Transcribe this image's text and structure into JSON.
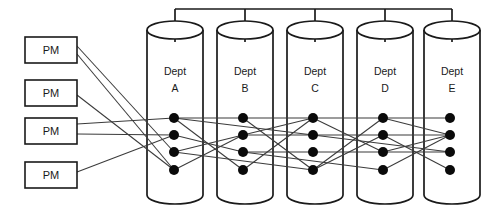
{
  "diagram": {
    "colors": {
      "stroke": "#1a1a1a",
      "edge": "#3b3b3b",
      "node": "#0a0a0a",
      "background": "#ffffff"
    },
    "pm_boxes": [
      {
        "id": "pm1",
        "label": "PM",
        "x": 25,
        "y": 37,
        "w": 52,
        "h": 26
      },
      {
        "id": "pm2",
        "label": "PM",
        "x": 25,
        "y": 80,
        "w": 52,
        "h": 26
      },
      {
        "id": "pm3",
        "label": "PM",
        "x": 25,
        "y": 118,
        "w": 52,
        "h": 26
      },
      {
        "id": "pm4",
        "label": "PM",
        "x": 25,
        "y": 162,
        "w": 52,
        "h": 26
      }
    ],
    "cylinders": [
      {
        "id": "deptA",
        "label_top": "Dept",
        "label_bottom": "A",
        "cx": 175,
        "top_y": 30,
        "bottom_y": 195,
        "rx": 28,
        "ry": 9
      },
      {
        "id": "deptB",
        "label_top": "Dept",
        "label_bottom": "B",
        "cx": 245,
        "top_y": 30,
        "bottom_y": 195,
        "rx": 28,
        "ry": 9
      },
      {
        "id": "deptC",
        "label_top": "Dept",
        "label_bottom": "C",
        "cx": 315,
        "top_y": 30,
        "bottom_y": 195,
        "rx": 28,
        "ry": 9
      },
      {
        "id": "deptD",
        "label_top": "Dept",
        "label_bottom": "D",
        "cx": 385,
        "top_y": 30,
        "bottom_y": 195,
        "rx": 28,
        "ry": 9
      },
      {
        "id": "deptE",
        "label_top": "Dept",
        "label_bottom": "E",
        "cx": 452,
        "top_y": 30,
        "bottom_y": 195,
        "rx": 28,
        "ry": 9
      }
    ],
    "bus": {
      "y": 9,
      "x_start": 175,
      "x_end": 452,
      "stem_down_to": 30
    },
    "node_columns": [
      {
        "cylinder": "deptA",
        "x": 174,
        "nodes_y": [
          118,
          135,
          152,
          170
        ]
      },
      {
        "cylinder": "deptB",
        "x": 243,
        "nodes_y": [
          118,
          135,
          152,
          170
        ]
      },
      {
        "cylinder": "deptC",
        "x": 313,
        "nodes_y": [
          118,
          135,
          152,
          170
        ]
      },
      {
        "cylinder": "deptD",
        "x": 383,
        "nodes_y": [
          118,
          135,
          152,
          170
        ]
      },
      {
        "cylinder": "deptE",
        "x": 450,
        "nodes_y": [
          118,
          135,
          152,
          170
        ]
      }
    ],
    "node_radius": 5,
    "pm_edges": [
      {
        "from": "pm1",
        "from_y": 46,
        "to_col": 0,
        "to_node": 2
      },
      {
        "from": "pm1",
        "from_y": 54,
        "to_col": 0,
        "to_node": 3
      },
      {
        "from": "pm2",
        "from_y": 95,
        "to_col": 0,
        "to_node": 3
      },
      {
        "from": "pm3",
        "from_y": 124,
        "to_col": 0,
        "to_node": 0
      },
      {
        "from": "pm3",
        "from_y": 134,
        "to_col": 0,
        "to_node": 1
      },
      {
        "from": "pm4",
        "from_y": 172,
        "to_col": 0,
        "to_node": 1
      }
    ],
    "inter_edges": [
      {
        "from_col": 0,
        "from_node": 0,
        "to_col": 1,
        "to_node": 0
      },
      {
        "from_col": 0,
        "from_node": 0,
        "to_col": 1,
        "to_node": 3
      },
      {
        "from_col": 0,
        "from_node": 1,
        "to_col": 1,
        "to_node": 2
      },
      {
        "from_col": 0,
        "from_node": 2,
        "to_col": 1,
        "to_node": 1
      },
      {
        "from_col": 0,
        "from_node": 3,
        "to_col": 1,
        "to_node": 1
      },
      {
        "from_col": 1,
        "from_node": 0,
        "to_col": 2,
        "to_node": 0
      },
      {
        "from_col": 1,
        "from_node": 0,
        "to_col": 2,
        "to_node": 3
      },
      {
        "from_col": 1,
        "from_node": 1,
        "to_col": 2,
        "to_node": 1
      },
      {
        "from_col": 1,
        "from_node": 1,
        "to_col": 2,
        "to_node": 0
      },
      {
        "from_col": 1,
        "from_node": 2,
        "to_col": 2,
        "to_node": 2
      },
      {
        "from_col": 1,
        "from_node": 3,
        "to_col": 2,
        "to_node": 0
      },
      {
        "from_col": 2,
        "from_node": 0,
        "to_col": 3,
        "to_node": 0
      },
      {
        "from_col": 2,
        "from_node": 0,
        "to_col": 3,
        "to_node": 2
      },
      {
        "from_col": 2,
        "from_node": 1,
        "to_col": 3,
        "to_node": 1
      },
      {
        "from_col": 2,
        "from_node": 2,
        "to_col": 3,
        "to_node": 2
      },
      {
        "from_col": 2,
        "from_node": 3,
        "to_col": 3,
        "to_node": 0
      },
      {
        "from_col": 2,
        "from_node": 3,
        "to_col": 3,
        "to_node": 1
      },
      {
        "from_col": 3,
        "from_node": 0,
        "to_col": 4,
        "to_node": 0
      },
      {
        "from_col": 3,
        "from_node": 0,
        "to_col": 4,
        "to_node": 1
      },
      {
        "from_col": 3,
        "from_node": 1,
        "to_col": 4,
        "to_node": 1
      },
      {
        "from_col": 3,
        "from_node": 1,
        "to_col": 4,
        "to_node": 3
      },
      {
        "from_col": 3,
        "from_node": 2,
        "to_col": 4,
        "to_node": 2
      },
      {
        "from_col": 3,
        "from_node": 2,
        "to_col": 4,
        "to_node": 1
      },
      {
        "from_col": 3,
        "from_node": 3,
        "to_col": 4,
        "to_node": 1
      }
    ],
    "long_edges": [
      {
        "from_col": 0,
        "from_node": 0,
        "to_col": 2,
        "to_node": 1
      },
      {
        "from_col": 0,
        "from_node": 2,
        "to_col": 2,
        "to_node": 3
      },
      {
        "from_col": 1,
        "from_node": 2,
        "to_col": 3,
        "to_node": 3
      },
      {
        "from_col": 2,
        "from_node": 1,
        "to_col": 4,
        "to_node": 2
      }
    ]
  }
}
